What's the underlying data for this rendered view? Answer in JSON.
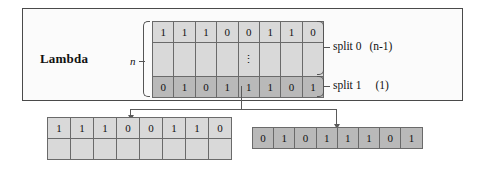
{
  "diagram": {
    "title_label": "Lambda",
    "size_label": "n",
    "main_grid": {
      "top_row": [
        "1",
        "1",
        "1",
        "0",
        "0",
        "1",
        "1",
        "0"
      ],
      "middle_row_marker": "⋮",
      "bottom_row": [
        "0",
        "1",
        "0",
        "1",
        "1",
        "1",
        "0",
        "1"
      ]
    },
    "annotations": [
      {
        "name": "split 0",
        "count": "(n-1)"
      },
      {
        "name": "split 1",
        "count": "(1)"
      }
    ],
    "output_left": {
      "values": [
        "1",
        "1",
        "1",
        "0",
        "0",
        "1",
        "1",
        "0"
      ],
      "empty_row": [
        "",
        "",
        "",
        "",
        "",
        "",
        "",
        ""
      ]
    },
    "output_right": {
      "values": [
        "0",
        "1",
        "0",
        "1",
        "1",
        "1",
        "0",
        "1"
      ]
    }
  }
}
